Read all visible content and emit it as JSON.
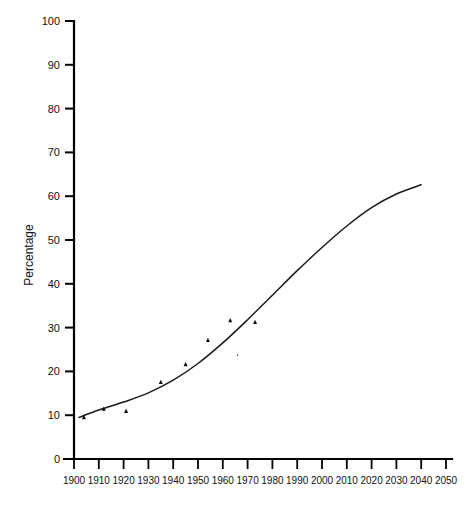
{
  "chart_data": {
    "type": "scatter",
    "title": "",
    "subtitle": "",
    "xlabel": "",
    "ylabel": "Percentage",
    "xlim": [
      1900,
      2050
    ],
    "ylim": [
      0,
      100
    ],
    "grid": false,
    "legend": "none",
    "x_tick_labels": [
      "1900",
      "1910",
      "1920",
      "1930",
      "1940",
      "1950",
      "1960",
      "1970",
      "1980",
      "1990",
      "2000",
      "2010",
      "2020",
      "2030",
      "2040",
      "2050"
    ],
    "x_tick_values": [
      1900,
      1910,
      1920,
      1930,
      1940,
      1950,
      1960,
      1970,
      1980,
      1990,
      2000,
      2010,
      2020,
      2030,
      2040,
      2050
    ],
    "y_tick_labels": [
      "0",
      "10",
      "20",
      "30",
      "40",
      "50",
      "60",
      "70",
      "80",
      "90",
      "100"
    ],
    "y_tick_values": [
      0,
      10,
      20,
      30,
      40,
      50,
      60,
      70,
      80,
      90,
      100
    ],
    "series": [
      {
        "name": "Observed data points",
        "marker": "triangle",
        "points": [
          {
            "x": 1904,
            "y": 9.6
          },
          {
            "x": 1912,
            "y": 11.5
          },
          {
            "x": 1921,
            "y": 11.0
          },
          {
            "x": 1935,
            "y": 17.6
          },
          {
            "x": 1945,
            "y": 21.7
          },
          {
            "x": 1954,
            "y": 27.2
          },
          {
            "x": 1963,
            "y": 31.7
          },
          {
            "x": 1966,
            "y": 23.8
          },
          {
            "x": 1973,
            "y": 31.3
          }
        ]
      },
      {
        "name": "Fitted projection curve",
        "marker": "none",
        "points": [
          {
            "x": 1902,
            "y": 9.5
          },
          {
            "x": 1910,
            "y": 11.2
          },
          {
            "x": 1920,
            "y": 13.0
          },
          {
            "x": 1930,
            "y": 15.1
          },
          {
            "x": 1940,
            "y": 18.0
          },
          {
            "x": 1950,
            "y": 21.8
          },
          {
            "x": 1960,
            "y": 26.5
          },
          {
            "x": 1970,
            "y": 31.8
          },
          {
            "x": 1980,
            "y": 37.4
          },
          {
            "x": 1990,
            "y": 43.0
          },
          {
            "x": 2000,
            "y": 48.3
          },
          {
            "x": 2010,
            "y": 53.2
          },
          {
            "x": 2020,
            "y": 57.4
          },
          {
            "x": 2030,
            "y": 60.5
          },
          {
            "x": 2040,
            "y": 62.6
          }
        ]
      }
    ]
  },
  "colors": {
    "background": "#ffffff",
    "axis": "#000000",
    "curve": "#1a1a1a",
    "marker": "#0c0c0c",
    "text": "#111111"
  }
}
